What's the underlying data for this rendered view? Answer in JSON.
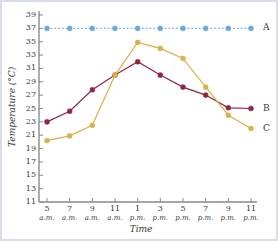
{
  "chart_data": {
    "type": "line",
    "title": "",
    "xlabel": "Time",
    "ylabel": "Temperature (°C)",
    "categories": [
      "5 a.m.",
      "7 a.m.",
      "9 a.m.",
      "11 a.m.",
      "1 p.m.",
      "3 p.m.",
      "5 p.m.",
      "7 p.m.",
      "9 p.m.",
      "11 p.m."
    ],
    "x_tick_numbers": [
      "5",
      "7",
      "9",
      "11",
      "1",
      "3",
      "5",
      "7",
      "9",
      "11"
    ],
    "x_tick_meridiems": [
      "a.m.",
      "a.m.",
      "a.m.",
      "a.m.",
      "p.m.",
      "p.m.",
      "p.m.",
      "p.m.",
      "p.m.",
      "p.m."
    ],
    "y_ticks": [
      11,
      13,
      15,
      17,
      19,
      21,
      23,
      25,
      27,
      29,
      31,
      33,
      35,
      37,
      39
    ],
    "ylim": [
      11,
      39
    ],
    "grid": false,
    "legend_position": "right-inline",
    "series": [
      {
        "name": "A",
        "color": "#6aa9dc",
        "linestyle": "dotted",
        "values": [
          37,
          37,
          37,
          37,
          37,
          37,
          37,
          37,
          37,
          37
        ]
      },
      {
        "name": "B",
        "color": "#8e2742",
        "linestyle": "solid",
        "values": [
          23,
          24.6,
          27.8,
          30,
          32,
          30,
          28.2,
          27,
          25.1,
          25
        ]
      },
      {
        "name": "C",
        "color": "#d6b34a",
        "linestyle": "solid",
        "values": [
          20.2,
          20.9,
          22.5,
          30,
          34.9,
          34,
          32.5,
          28.2,
          24,
          22
        ]
      }
    ]
  },
  "axis": {
    "line_color": "#8a8a8a"
  }
}
